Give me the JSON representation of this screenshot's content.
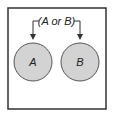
{
  "diagram": {
    "type": "venn-disjoint",
    "label": "(A or B)",
    "sets": [
      {
        "name": "A",
        "fill": "#d3d3d3"
      },
      {
        "name": "B",
        "fill": "#d3d3d3"
      }
    ],
    "colors": {
      "stroke": "#333333",
      "fill": "#d3d3d3",
      "background": "#ffffff"
    }
  }
}
